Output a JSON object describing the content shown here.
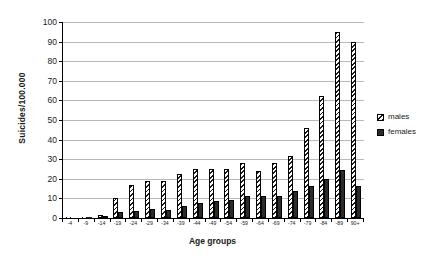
{
  "chart_data": {
    "type": "bar",
    "title": "",
    "xlabel": "Age groups",
    "ylabel": "Suicides/100.000",
    "ylim": [
      0,
      100
    ],
    "ytick_step": 10,
    "yticks": [
      0,
      10,
      20,
      30,
      40,
      50,
      60,
      70,
      80,
      90,
      100
    ],
    "grid": true,
    "legend_position": "right",
    "categories": [
      "-4",
      "-9",
      "-14",
      "-19",
      "-24",
      "-29",
      "-34",
      "-39",
      "-44",
      "-49",
      "-54",
      "-59",
      "-64",
      "-69",
      "-74",
      "-79",
      "-84",
      "-89",
      "90+"
    ],
    "series": [
      {
        "name": "males",
        "pattern": "diagonal-hatch",
        "values": [
          0.1,
          0.2,
          1.5,
          10.0,
          17.0,
          19.0,
          19.0,
          22.5,
          25.0,
          25.0,
          25.0,
          28.0,
          24.0,
          28.0,
          31.5,
          46.0,
          62.5,
          95.0,
          90.0
        ]
      },
      {
        "name": "females",
        "pattern": "solid",
        "values": [
          0.0,
          0.1,
          0.5,
          3.0,
          3.5,
          4.5,
          4.0,
          6.0,
          7.5,
          8.5,
          9.0,
          11.0,
          11.0,
          11.0,
          14.0,
          16.5,
          20.0,
          24.5,
          16.5
        ]
      }
    ],
    "colors": {
      "males_fill": "#ffffff",
      "males_stroke": "#1a1a1a",
      "females_fill": "#2b2b2b",
      "gridline": "#b9b9b9",
      "axis": "#000000",
      "background": "#ffffff"
    }
  },
  "legend": {
    "items": [
      {
        "label": "males"
      },
      {
        "label": "females"
      }
    ]
  }
}
